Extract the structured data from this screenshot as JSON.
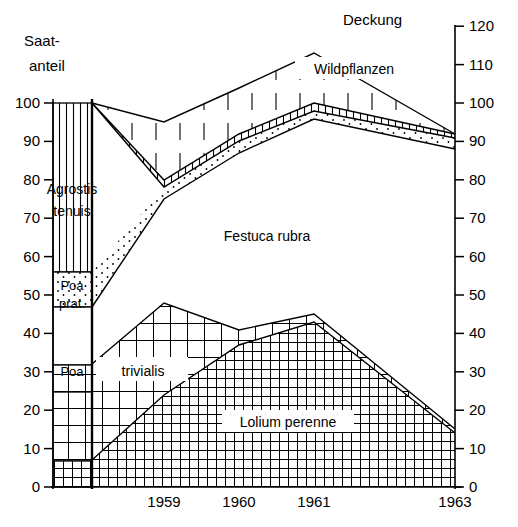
{
  "labels": {
    "left_axis_title_line1": "Saat-",
    "left_axis_title_line2": "anteil",
    "right_axis_title": "Deckung"
  },
  "axes": {
    "left_ticks": [
      "100",
      "90",
      "80",
      "70",
      "60",
      "50",
      "40",
      "30",
      "20",
      "10",
      "0"
    ],
    "right_ticks": [
      "120",
      "110",
      "100",
      "90",
      "80",
      "70",
      "60",
      "50",
      "40",
      "30",
      "20",
      "10",
      "0"
    ],
    "x_ticks": [
      "1959",
      "1960",
      "1961",
      "1963"
    ]
  },
  "series_labels": {
    "agrostis": "Agrostis",
    "agrostis2": "tenuis",
    "poa_prat": "Poa",
    "poa_prat2": "prat.",
    "festuca": "Festuca rubra",
    "poa_triv": "Poa",
    "poa_triv2": "trivialis",
    "lolium": "Lolium perenne",
    "wild": "Wildpflanzen"
  },
  "chart_data": {
    "type": "area",
    "title": "",
    "subtitle": "",
    "xlabel": "",
    "ylabel": "Saat-anteil",
    "ylabel_right": "Deckung",
    "xlim": [
      1958.0,
      1963.0
    ],
    "ylim": [
      0,
      120
    ],
    "ylim_left": [
      0,
      100
    ],
    "grid": false,
    "legend_position": "in-plot-annotations",
    "x": [
      1958.0,
      1958.3,
      1959.0,
      1960.0,
      1961.0,
      1963.0
    ],
    "x_tick_values": [
      1959,
      1960,
      1961,
      1963
    ],
    "seed_mix": {
      "description": "Sown seed proportions shown as a stacked bar at left of the vertical divider (0-100%)",
      "categories": [
        "Lolium perenne",
        "Poa trivialis",
        "Festuca rubra",
        "Poa pratensis",
        "Agrostis tenuis"
      ],
      "cumulative_tops": [
        25,
        32,
        47,
        56,
        100
      ],
      "values": [
        25,
        7,
        15,
        9,
        44
      ]
    },
    "series": [
      {
        "name": "Lolium perenne",
        "pattern": "fine-grid",
        "cumulative_top": [
          25,
          7,
          24,
          37,
          43,
          14
        ]
      },
      {
        "name": "Poa trivialis",
        "pattern": "coarse-grid",
        "cumulative_top": [
          32,
          7,
          48,
          41,
          45,
          15
        ]
      },
      {
        "name": "Festuca rubra",
        "pattern": "blank",
        "cumulative_top": [
          47,
          47,
          75,
          87,
          96,
          88
        ]
      },
      {
        "name": "Poa pratensis",
        "pattern": "dotted",
        "cumulative_top": [
          56,
          56,
          78,
          90,
          98,
          91
        ]
      },
      {
        "name": "Agrostis tenuis",
        "pattern": "vertical-hatch-dense",
        "cumulative_top": [
          100,
          100,
          80,
          92,
          100,
          92
        ]
      },
      {
        "name": "Wildpflanzen",
        "pattern": "vertical-hatch-sparse",
        "cumulative_top": [
          100,
          100,
          95,
          104,
          113,
          92
        ]
      }
    ],
    "total_cover_line": [
      100,
      100,
      95,
      104,
      113,
      92
    ]
  }
}
